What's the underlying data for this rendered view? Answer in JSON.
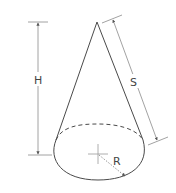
{
  "diagram": {
    "type": "cone",
    "labels": {
      "height": "H",
      "slant": "S",
      "radius": "R"
    },
    "colors": {
      "outline": "#4a4a4a",
      "dimension": "#7a7a7a",
      "background": "#ffffff"
    }
  }
}
